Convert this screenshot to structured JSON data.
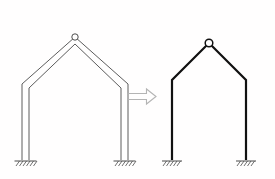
{
  "figure": {
    "type": "engineering-diagram",
    "background_color": "#fffefe",
    "line_color": "#3a3a3a",
    "line_color_dark": "#141414",
    "arrow_color": "#b9b9b9"
  },
  "left_diagram": {
    "name": "real-gable-frame",
    "description": "Two-hinged gable frame drawn with finite member width (double outline)",
    "stroke": "#4a4a4a",
    "stroke_width": 0.9,
    "apex_hinge": {
      "cx": 75,
      "cy": 37,
      "r": 3.2,
      "label": "hinge"
    },
    "outer_polyline": "22,160 22,84 75,37 128,84 128,160",
    "inner_polyline": "29,160 29,88 75,44 121,88 121,160",
    "supports": [
      {
        "name": "left-fixed-support",
        "x": 25.5,
        "y": 160,
        "half_width": 11,
        "hatch_count": 6
      },
      {
        "name": "right-fixed-support",
        "x": 124.5,
        "y": 160,
        "half_width": 11,
        "hatch_count": 6
      }
    ]
  },
  "arrow": {
    "name": "transform-arrow",
    "direction": "right",
    "x": 128,
    "y": 89,
    "width": 28,
    "height": 15,
    "stroke": "#b4b4b4",
    "stroke_width": 1.1,
    "fill": "none"
  },
  "right_diagram": {
    "name": "idealized-line-frame",
    "description": "Idealized centre-line stick model of the same gable frame",
    "stroke": "#111111",
    "stroke_width": 2.2,
    "apex_hinge": {
      "cx": 209,
      "cy": 43,
      "r": 3.6,
      "label": "hinge"
    },
    "centerline_polyline": "172,160 172,80 209,43 246,80 246,160",
    "supports": [
      {
        "name": "left-fixed-support",
        "x": 172,
        "y": 160,
        "half_width": 10,
        "hatch_count": 5
      },
      {
        "name": "right-fixed-support",
        "x": 246,
        "y": 160,
        "half_width": 10,
        "hatch_count": 5
      }
    ]
  }
}
